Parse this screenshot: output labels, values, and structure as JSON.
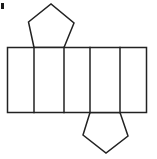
{
  "figure": {
    "background_color": "#ffffff",
    "stroke_color": "#222222",
    "fill_color": "#ffffff",
    "stroke_width": 1.5,
    "canvas": {
      "width": 157,
      "height": 159
    },
    "corner_mark": {
      "name": "corner-mark",
      "color": "#1a1a1a",
      "x": 1,
      "y": 3,
      "width": 3,
      "height": 6
    },
    "band": {
      "label": "lateral-faces-band",
      "x": 7.5,
      "y": 47.5,
      "width": 139,
      "height": 65,
      "cell_count": 5,
      "divider_x": [
        34,
        64,
        90,
        120
      ],
      "cells": [
        {
          "label": "lateral-face-1",
          "x1": 7.5,
          "x2": 34
        },
        {
          "label": "lateral-face-2",
          "x1": 34,
          "x2": 64
        },
        {
          "label": "lateral-face-3",
          "x1": 64,
          "x2": 90
        },
        {
          "label": "lateral-face-4",
          "x1": 90,
          "x2": 120
        },
        {
          "label": "lateral-face-5",
          "x1": 120,
          "x2": 146.5
        }
      ]
    },
    "top_pentagon": {
      "label": "top-pentagon-face",
      "points": "34,47.5 28.5,22 51,4 74,23 64,47.5"
    },
    "bottom_pentagon": {
      "label": "bottom-pentagon-face",
      "points": "90,112.5 83,135 106,153 128,136 120,112.5"
    }
  }
}
